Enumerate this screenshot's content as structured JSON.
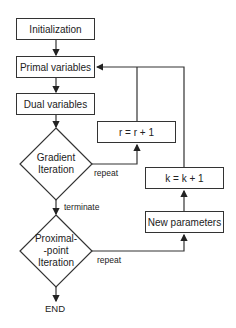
{
  "nodes": {
    "initialization": "Initialization",
    "primal": "Primal variables",
    "dual": "Dual variables",
    "gradient_line1": "Gradient",
    "gradient_line2": "Iteration",
    "r_update": "r = r + 1",
    "k_update": "k = k + 1",
    "new_params": "New parameters",
    "proximal_line1": "Proximal-",
    "proximal_line2": "-point",
    "proximal_line3": "Iteration",
    "end": "END"
  },
  "edge_labels": {
    "gradient_repeat": "repeat",
    "gradient_terminate": "terminate",
    "proximal_repeat": "repeat"
  },
  "colors": {
    "stroke": "#333333",
    "background": "#ffffff"
  }
}
